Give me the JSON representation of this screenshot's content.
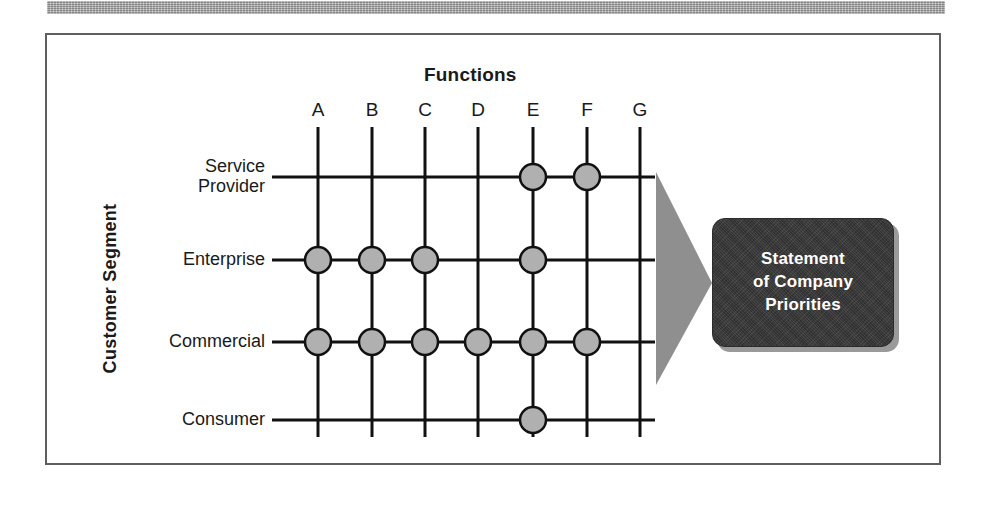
{
  "figure": {
    "title": "Functions",
    "y_axis_label": "Customer Segment",
    "result_box": {
      "line1": "Statement",
      "line2": "of Company",
      "line3": "Priorities",
      "text_color": "#ffffff",
      "fill_color": "#3a3a3a"
    },
    "arrow": {
      "name": "right-pointing-triangle",
      "fill_color": "#8f8f8f"
    },
    "frame_color": "#5f5f5f",
    "top_bar_color": "#a8a8a8"
  },
  "chart_data": {
    "type": "heatmap",
    "title": "Functions",
    "xlabel": "Functions",
    "ylabel": "Customer Segment",
    "categories": [
      "A",
      "B",
      "C",
      "D",
      "E",
      "F",
      "G"
    ],
    "rows": [
      "Service Provider",
      "Enterprise",
      "Commercial",
      "Consumer"
    ],
    "row_labels_multiline": [
      [
        "Service",
        "Provider"
      ],
      [
        "Enterprise"
      ],
      [
        "Commercial"
      ],
      [
        "Consumer"
      ]
    ],
    "grid": true,
    "legend": "none",
    "marker": {
      "shape": "circle",
      "fill_color": "#b0b0b0",
      "stroke_color": "#111111",
      "radius": 13
    },
    "series": [
      {
        "name": "Service Provider",
        "values": [
          0,
          0,
          0,
          0,
          1,
          1,
          0
        ]
      },
      {
        "name": "Enterprise",
        "values": [
          1,
          1,
          1,
          0,
          1,
          0,
          0
        ]
      },
      {
        "name": "Commercial",
        "values": [
          1,
          1,
          1,
          1,
          1,
          1,
          0
        ]
      },
      {
        "name": "Consumer",
        "values": [
          0,
          0,
          0,
          0,
          1,
          0,
          0
        ]
      }
    ],
    "marked_cells": [
      {
        "row": "Service Provider",
        "col": "E"
      },
      {
        "row": "Service Provider",
        "col": "F"
      },
      {
        "row": "Enterprise",
        "col": "A"
      },
      {
        "row": "Enterprise",
        "col": "B"
      },
      {
        "row": "Enterprise",
        "col": "C"
      },
      {
        "row": "Enterprise",
        "col": "E"
      },
      {
        "row": "Commercial",
        "col": "A"
      },
      {
        "row": "Commercial",
        "col": "B"
      },
      {
        "row": "Commercial",
        "col": "C"
      },
      {
        "row": "Commercial",
        "col": "D"
      },
      {
        "row": "Commercial",
        "col": "E"
      },
      {
        "row": "Commercial",
        "col": "F"
      },
      {
        "row": "Consumer",
        "col": "E"
      }
    ]
  },
  "geometry": {
    "col_x": [
      318,
      372,
      425,
      478,
      533,
      587,
      640
    ],
    "row_y": [
      177,
      260,
      342,
      420
    ],
    "grid_top": 127,
    "grid_bottom": 437,
    "row_line_left": 272,
    "row_line_right": 655,
    "col_label_y": 99,
    "row_label_x": 90,
    "row_label_right": 265
  }
}
